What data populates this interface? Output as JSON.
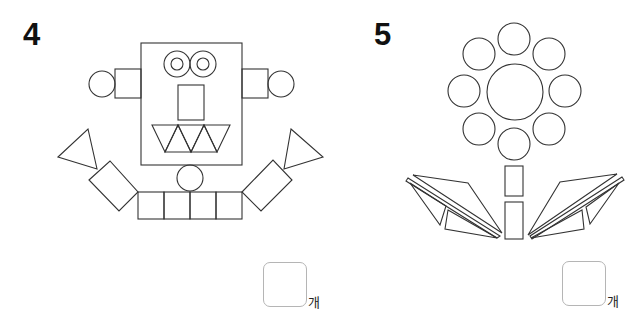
{
  "problems": [
    {
      "number": "4",
      "subject": "robot made of shapes",
      "answer_value": "",
      "unit": "개"
    },
    {
      "number": "5",
      "subject": "flower made of shapes",
      "answer_value": "",
      "unit": "개"
    }
  ],
  "style": {
    "stroke": "#333333",
    "stroke_width": 1.1,
    "box_border": "#b5b5b5"
  },
  "robot": {
    "head": {
      "x": 141,
      "y": 43,
      "w": 101,
      "h": 122
    },
    "eyes": [
      {
        "cx": 177,
        "cy": 64,
        "r_outer": 13,
        "r_inner": 6
      },
      {
        "cx": 203,
        "cy": 64,
        "r_outer": 13,
        "r_inner": 6
      }
    ],
    "nose": {
      "x": 178,
      "y": 85,
      "w": 26,
      "h": 35
    },
    "teeth": [
      [
        [
          152,
          125
        ],
        [
          178,
          125
        ],
        [
          165,
          152
        ]
      ],
      [
        [
          165,
          152
        ],
        [
          178,
          125
        ],
        [
          191,
          152
        ]
      ],
      [
        [
          178,
          125
        ],
        [
          204,
          125
        ],
        [
          191,
          152
        ]
      ],
      [
        [
          191,
          152
        ],
        [
          204,
          125
        ],
        [
          217,
          152
        ]
      ],
      [
        [
          204,
          125
        ],
        [
          230,
          125
        ],
        [
          217,
          152
        ]
      ]
    ],
    "ears": [
      {
        "rect": {
          "x": 115,
          "y": 69,
          "w": 26,
          "h": 29
        },
        "circle": {
          "cx": 102,
          "cy": 84,
          "r": 13
        }
      },
      {
        "rect": {
          "x": 242,
          "y": 69,
          "w": 26,
          "h": 29
        },
        "circle": {
          "cx": 281,
          "cy": 84,
          "r": 13
        }
      }
    ],
    "neck": {
      "cx": 190,
      "cy": 178,
      "r": 13
    },
    "body_squares": [
      {
        "x": 138,
        "y": 192,
        "w": 26,
        "h": 27
      },
      {
        "x": 164,
        "y": 192,
        "w": 26,
        "h": 27
      },
      {
        "x": 190,
        "y": 192,
        "w": 26,
        "h": 27
      },
      {
        "x": 216,
        "y": 192,
        "w": 26,
        "h": 27
      }
    ],
    "arms": [
      [
        [
          89,
          180
        ],
        [
          110,
          161
        ],
        [
          138,
          192
        ],
        [
          119,
          211
        ]
      ],
      [
        [
          242,
          192
        ],
        [
          273,
          160
        ],
        [
          292,
          180
        ],
        [
          261,
          211
        ]
      ]
    ],
    "hands": [
      [
        [
          58,
          157
        ],
        [
          88,
          129
        ],
        [
          97,
          169
        ]
      ],
      [
        [
          291,
          129
        ],
        [
          323,
          157
        ],
        [
          284,
          169
        ]
      ]
    ]
  },
  "flower": {
    "center": {
      "cx": 515,
      "cy": 92,
      "r": 28
    },
    "petals": [
      {
        "cx": 514,
        "cy": 39,
        "r": 16
      },
      {
        "cx": 479,
        "cy": 54,
        "r": 16
      },
      {
        "cx": 549,
        "cy": 54,
        "r": 16
      },
      {
        "cx": 464,
        "cy": 91,
        "r": 16
      },
      {
        "cx": 565,
        "cy": 91,
        "r": 16
      },
      {
        "cx": 479,
        "cy": 129,
        "r": 16
      },
      {
        "cx": 549,
        "cy": 129,
        "r": 16
      },
      {
        "cx": 514,
        "cy": 144,
        "r": 16
      }
    ],
    "stems": [
      {
        "x": 505,
        "y": 166,
        "w": 18,
        "h": 30
      },
      {
        "x": 505,
        "y": 202,
        "w": 18,
        "h": 37
      }
    ],
    "leaves": [
      [
        [
          413,
          175
        ],
        [
          468,
          183
        ],
        [
          502,
          233
        ]
      ],
      [
        [
          408,
          178
        ],
        [
          500,
          236
        ],
        [
          497,
          238
        ],
        [
          406,
          181
        ]
      ],
      [
        [
          410,
          183
        ],
        [
          446,
          206
        ],
        [
          440,
          225
        ]
      ],
      [
        [
          448,
          210
        ],
        [
          497,
          238
        ],
        [
          445,
          229
        ]
      ],
      [
        [
          617,
          174
        ],
        [
          560,
          182
        ],
        [
          528,
          235
        ]
      ],
      [
        [
          622,
          177
        ],
        [
          530,
          236
        ],
        [
          532,
          239
        ],
        [
          624,
          180
        ]
      ],
      [
        [
          619,
          183
        ],
        [
          586,
          207
        ],
        [
          590,
          224
        ]
      ],
      [
        [
          582,
          210
        ],
        [
          531,
          238
        ],
        [
          584,
          229
        ]
      ]
    ]
  }
}
